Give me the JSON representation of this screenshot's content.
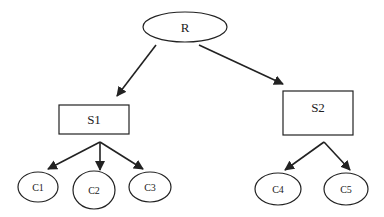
{
  "diagram": {
    "type": "tree",
    "colors": {
      "stroke": "#222222",
      "background": "#ffffff"
    },
    "nodes": {
      "R": {
        "label": "R",
        "shape": "ellipse"
      },
      "S1": {
        "label": "S1",
        "shape": "rectangle"
      },
      "S2": {
        "label": "S2",
        "shape": "rectangle"
      },
      "C1": {
        "label": "C1",
        "shape": "ellipse"
      },
      "C2": {
        "label": "C2",
        "shape": "ellipse"
      },
      "C3": {
        "label": "C3",
        "shape": "ellipse"
      },
      "C4": {
        "label": "C4",
        "shape": "ellipse"
      },
      "C5": {
        "label": "C5",
        "shape": "ellipse"
      }
    },
    "edges": [
      {
        "from": "R",
        "to": "S1"
      },
      {
        "from": "R",
        "to": "S2"
      },
      {
        "from": "S1",
        "to": "C1"
      },
      {
        "from": "S1",
        "to": "C2"
      },
      {
        "from": "S1",
        "to": "C3"
      },
      {
        "from": "S2",
        "to": "C4"
      },
      {
        "from": "S2",
        "to": "C5"
      }
    ]
  }
}
